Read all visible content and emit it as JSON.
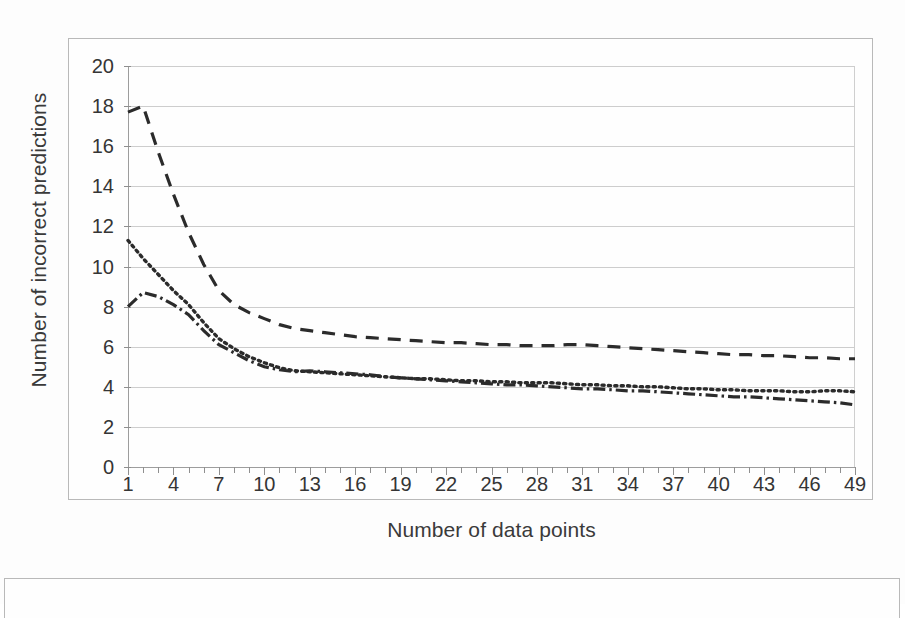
{
  "chart_data": {
    "type": "line",
    "title": "",
    "xlabel": "Number of data points",
    "ylabel": "Number of incorrect predictions",
    "xlim": [
      1,
      49
    ],
    "ylim": [
      0,
      20
    ],
    "y_ticks": [
      0,
      2,
      4,
      6,
      8,
      10,
      12,
      14,
      16,
      18,
      20
    ],
    "x_ticks_labeled": [
      1,
      4,
      7,
      10,
      13,
      16,
      19,
      22,
      25,
      28,
      31,
      34,
      37,
      40,
      43,
      46,
      49
    ],
    "x_tick_step_minor": 1,
    "grid": "horizontal",
    "legend": "none",
    "x": [
      1,
      2,
      3,
      4,
      5,
      6,
      7,
      8,
      9,
      10,
      11,
      12,
      13,
      14,
      15,
      16,
      17,
      18,
      19,
      20,
      21,
      22,
      23,
      24,
      25,
      26,
      27,
      28,
      29,
      30,
      31,
      32,
      33,
      34,
      35,
      36,
      37,
      38,
      39,
      40,
      41,
      42,
      43,
      44,
      45,
      46,
      47,
      48,
      49
    ],
    "series": [
      {
        "name": "dashed-series",
        "style": "dashed",
        "color": "#2b2b2b",
        "values": [
          17.7,
          18.0,
          15.7,
          13.6,
          11.7,
          10.1,
          8.8,
          8.1,
          7.7,
          7.4,
          7.1,
          6.9,
          6.8,
          6.7,
          6.6,
          6.5,
          6.45,
          6.4,
          6.35,
          6.3,
          6.25,
          6.2,
          6.2,
          6.15,
          6.1,
          6.1,
          6.05,
          6.05,
          6.05,
          6.1,
          6.1,
          6.05,
          6.0,
          5.95,
          5.9,
          5.85,
          5.8,
          5.75,
          5.7,
          5.65,
          5.6,
          5.6,
          5.55,
          5.55,
          5.5,
          5.45,
          5.45,
          5.4,
          5.4
        ]
      },
      {
        "name": "dotted-series",
        "style": "dotted",
        "color": "#2b2b2b",
        "values": [
          11.3,
          10.4,
          9.6,
          8.8,
          8.1,
          7.2,
          6.4,
          5.9,
          5.5,
          5.2,
          4.95,
          4.8,
          4.75,
          4.7,
          4.65,
          4.6,
          4.55,
          4.5,
          4.45,
          4.4,
          4.4,
          4.35,
          4.3,
          4.3,
          4.25,
          4.25,
          4.2,
          4.2,
          4.2,
          4.15,
          4.1,
          4.1,
          4.05,
          4.05,
          4.0,
          4.0,
          3.95,
          3.9,
          3.9,
          3.85,
          3.85,
          3.8,
          3.8,
          3.8,
          3.75,
          3.75,
          3.8,
          3.8,
          3.75
        ]
      },
      {
        "name": "dash-dot-series",
        "style": "dash-dot",
        "color": "#2b2b2b",
        "values": [
          8.0,
          8.7,
          8.5,
          8.1,
          7.6,
          6.8,
          6.1,
          5.7,
          5.3,
          5.0,
          4.85,
          4.75,
          4.8,
          4.75,
          4.7,
          4.65,
          4.6,
          4.5,
          4.45,
          4.4,
          4.35,
          4.3,
          4.25,
          4.2,
          4.15,
          4.1,
          4.1,
          4.05,
          4.0,
          3.95,
          3.9,
          3.9,
          3.85,
          3.8,
          3.8,
          3.75,
          3.7,
          3.65,
          3.6,
          3.55,
          3.5,
          3.5,
          3.45,
          3.4,
          3.35,
          3.3,
          3.25,
          3.2,
          3.1
        ]
      }
    ]
  }
}
